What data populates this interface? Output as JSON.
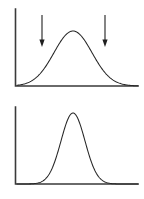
{
  "figure": {
    "background_color": "#ffffff",
    "axis_color": "#3a3a3a",
    "curve_color": "#262626",
    "arrow_color": "#1f1f1f",
    "width": 144,
    "height": 199
  },
  "chart_data": {
    "type": "line",
    "xlabel": "",
    "ylabel": "",
    "grid": false,
    "legend": "none",
    "panels": [
      {
        "name": "top-panel",
        "label": "Wide distribution with two marker arrows",
        "curve": "normal",
        "mean": 73,
        "std_dev": 19,
        "peak_x": 73,
        "peak_y": 31,
        "baseline_y": 86,
        "axis_origin_x": 15,
        "axis_top_y": 9,
        "axis_right_x": 138,
        "xlim": [
          15,
          138
        ],
        "ylim": [
          0,
          1
        ],
        "annotations": [
          {
            "name": "left-arrow",
            "x": 42,
            "top_y": 15,
            "tip_y": 47,
            "direction": "down"
          },
          {
            "name": "right-arrow",
            "x": 105,
            "top_y": 15,
            "tip_y": 47,
            "direction": "down"
          }
        ]
      },
      {
        "name": "bottom-panel",
        "label": "Narrow distribution, no arrows",
        "curve": "normal",
        "mean": 73,
        "std_dev": 12,
        "peak_x": 73,
        "peak_y": 113,
        "baseline_y": 184,
        "axis_origin_x": 15,
        "axis_top_y": 107,
        "axis_right_x": 138,
        "xlim": [
          15,
          138
        ],
        "ylim": [
          0,
          1
        ],
        "annotations": []
      }
    ]
  },
  "accessibility": {
    "figure_description": "Two stacked line plots on L-shaped axes. The upper plot shows a broad bell-shaped normal curve with two vertical downward arrows pointing at positions on either side of the peak. The lower plot shows a narrower, taller bell-shaped normal curve with the same peak location and no arrows."
  }
}
